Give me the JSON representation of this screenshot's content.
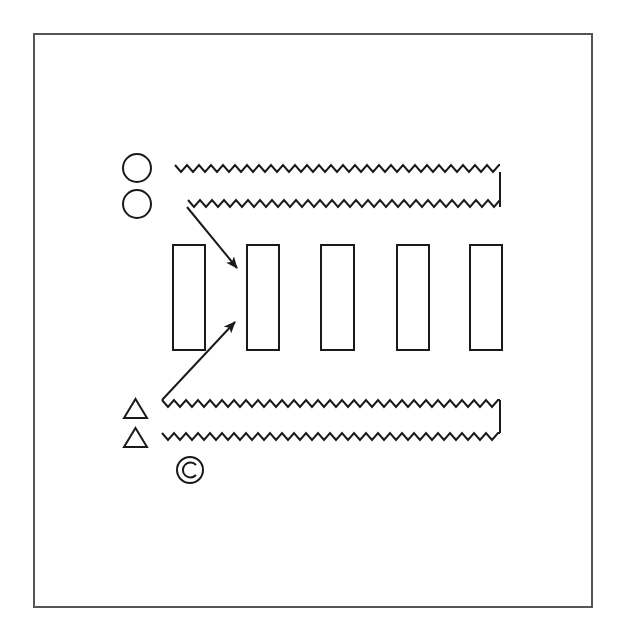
{
  "diagram": {
    "type": "drill-diagram",
    "frame": {
      "x": 34,
      "y": 34,
      "width": 558,
      "height": 573,
      "color": "#555555"
    },
    "stroke_color": "#1a1a1a",
    "players": {
      "circles": [
        {
          "id": "circle-1",
          "cx": 137,
          "cy": 168,
          "r": 14
        },
        {
          "id": "circle-2",
          "cx": 137,
          "cy": 204,
          "r": 14
        }
      ],
      "triangles": [
        {
          "id": "triangle-1",
          "x": 124,
          "y": 399,
          "w": 23,
          "h": 19
        },
        {
          "id": "triangle-2",
          "x": 124,
          "y": 428,
          "w": 23,
          "h": 19
        }
      ],
      "coach": {
        "id": "coach",
        "symbol": "©",
        "cx": 190,
        "cy": 470,
        "r": 13
      }
    },
    "cones": [
      {
        "id": "cone-1",
        "x": 173,
        "y": 245,
        "w": 32,
        "h": 105
      },
      {
        "id": "cone-2",
        "x": 247,
        "y": 245,
        "w": 32,
        "h": 105
      },
      {
        "id": "cone-3",
        "x": 321,
        "y": 245,
        "w": 33,
        "h": 105
      },
      {
        "id": "cone-4",
        "x": 397,
        "y": 245,
        "w": 32,
        "h": 105
      },
      {
        "id": "cone-5",
        "x": 470,
        "y": 245,
        "w": 32,
        "h": 105
      }
    ],
    "dribble_paths": [
      {
        "id": "top-outer",
        "x1": 175,
        "x2": 500,
        "y": 165,
        "amp": 7,
        "period": 12
      },
      {
        "id": "top-inner",
        "x1": 188,
        "x2": 500,
        "y": 200,
        "amp": 7,
        "period": 12
      },
      {
        "id": "bottom-outer",
        "x1": 162,
        "x2": 500,
        "y": 400,
        "amp": 7,
        "period": 12
      },
      {
        "id": "bottom-inner",
        "x1": 162,
        "x2": 500,
        "y": 433,
        "amp": 7,
        "period": 12
      }
    ],
    "connectors": [
      {
        "id": "top-right-connector",
        "x": 500,
        "y1": 172,
        "y2": 207
      },
      {
        "id": "bottom-right-connector",
        "x": 500,
        "y1": 400,
        "y2": 433
      }
    ],
    "arrows": [
      {
        "id": "arrow-down",
        "x1": 187,
        "y1": 207,
        "x2": 237,
        "y2": 268
      },
      {
        "id": "arrow-up",
        "x1": 162,
        "y1": 400,
        "x2": 235,
        "y2": 322
      }
    ]
  }
}
